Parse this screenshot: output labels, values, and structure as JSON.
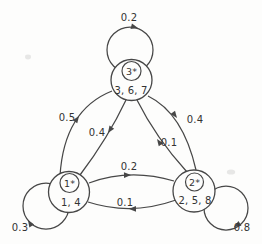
{
  "figure": {
    "kind": "markov-chain-state-transition-diagram",
    "background_color": "#fdfdfc",
    "line_color": "#474747",
    "text_color": "#333333"
  },
  "diagram": {
    "states": [
      {
        "id": "3",
        "label": "3*",
        "members": "3, 6, 7",
        "self_transition_probability": "0.2"
      },
      {
        "id": "1",
        "label": "1*",
        "members": "1, 4",
        "self_transition_probability": "0.3"
      },
      {
        "id": "2",
        "label": "2*",
        "members": "2, 5, 8",
        "self_transition_probability": "0.8"
      }
    ],
    "transitions": [
      {
        "from": "1",
        "to": "3",
        "probability": "0.5"
      },
      {
        "from": "3",
        "to": "1",
        "probability": "0.4"
      },
      {
        "from": "3",
        "to": "2",
        "probability": "0.4"
      },
      {
        "from": "2",
        "to": "3",
        "probability": "0.1"
      },
      {
        "from": "1",
        "to": "2",
        "probability": "0.2"
      },
      {
        "from": "2",
        "to": "1",
        "probability": "0.1"
      }
    ]
  }
}
